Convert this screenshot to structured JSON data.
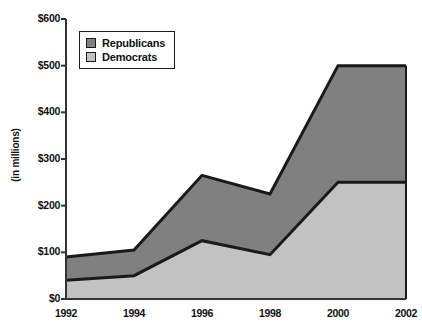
{
  "chart_data": {
    "type": "area",
    "stacked": true,
    "title": "",
    "subtitle": "",
    "xlabel": "",
    "ylabel": "(in millions)",
    "categories": [
      1992,
      1994,
      1996,
      1998,
      2000,
      2002
    ],
    "x_tick_labels": [
      "1992",
      "1994",
      "1996",
      "1998",
      "2000",
      "2002"
    ],
    "y_tick_labels": [
      "$0",
      "$100",
      "$200",
      "$300",
      "$400",
      "$500",
      "$600"
    ],
    "y_tick_values": [
      0,
      100,
      200,
      300,
      400,
      500,
      600
    ],
    "ylim": [
      0,
      600
    ],
    "xlim": [
      1992,
      2002
    ],
    "grid": false,
    "legend_position": "top-left-inside",
    "series": [
      {
        "name": "Republicans",
        "color": "#808080",
        "values": [
          50,
          55,
          140,
          130,
          250,
          250
        ],
        "cumulative_top": [
          90,
          105,
          265,
          225,
          500,
          500
        ]
      },
      {
        "name": "Democrats",
        "color": "#c2c2c2",
        "values": [
          40,
          50,
          125,
          95,
          250,
          250
        ],
        "cumulative_top": [
          40,
          50,
          125,
          95,
          250,
          250
        ]
      }
    ]
  },
  "legend": {
    "items": [
      {
        "label": "Republicans",
        "swatch_color": "#808080"
      },
      {
        "label": "Democrats",
        "swatch_color": "#c2c2c2"
      }
    ]
  },
  "axes": {
    "y_title": "(in millions)",
    "y_labels": [
      "$600",
      "$500",
      "$400",
      "$300",
      "$200",
      "$100",
      "$0"
    ],
    "x_labels": [
      "1992",
      "1994",
      "1996",
      "1998",
      "2000",
      "2002"
    ]
  },
  "colors": {
    "republicans": "#808080",
    "democrats": "#c2c2c2",
    "outline": "#1a1a1a",
    "background": "#ffffff",
    "text": "#111111"
  }
}
